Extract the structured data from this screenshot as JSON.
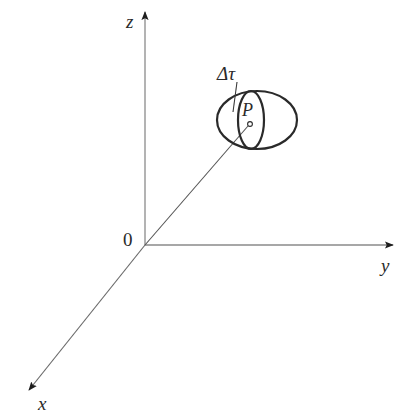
{
  "diagram": {
    "type": "3d-coordinate-system",
    "axes": {
      "x": {
        "label": "x"
      },
      "y": {
        "label": "y"
      },
      "z": {
        "label": "z"
      }
    },
    "origin": {
      "label": "0"
    },
    "point": {
      "label": "P"
    },
    "volume_element": {
      "label": "Δτ"
    },
    "colors": {
      "axis": "#8a8a8a",
      "ellipse": "#2a2a2a",
      "text": "#2a2a2a",
      "background": "#ffffff"
    }
  }
}
